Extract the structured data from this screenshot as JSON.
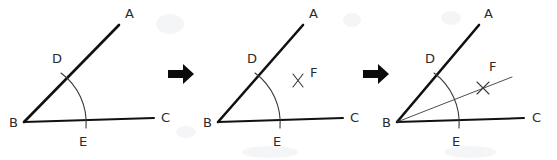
{
  "figure": {
    "background_color": "#ffffff",
    "ink_color": "#111111",
    "light_ink_color": "#3a3a3a",
    "arrow_glyph": "right-arrow",
    "panels": [
      {
        "id": "panel-1",
        "step": "1",
        "caption": "",
        "vertex_label": "B",
        "labels": [
          {
            "name": "label-a",
            "text": "A",
            "x": 125,
            "y": 18
          },
          {
            "name": "label-d",
            "text": "D",
            "x": 52,
            "y": 63
          },
          {
            "name": "label-b",
            "text": "B",
            "x": 9,
            "y": 127
          },
          {
            "name": "label-e",
            "text": "E",
            "x": 79,
            "y": 146
          },
          {
            "name": "label-c",
            "text": "C",
            "x": 161,
            "y": 122
          }
        ],
        "geometry": {
          "vertex": [
            24,
            122
          ],
          "ray_a_end": [
            119,
            25
          ],
          "ray_c_end": [
            154,
            118
          ],
          "arc_from": [
            66,
            79
          ],
          "arc_to": [
            86,
            126
          ],
          "point_d": [
            63,
            76
          ],
          "point_e": [
            85,
            120
          ]
        },
        "has_cross": false,
        "has_bisector": false
      },
      {
        "id": "panel-2",
        "step": "2",
        "caption": "",
        "vertex_label": "B",
        "labels": [
          {
            "name": "label-a",
            "text": "A",
            "x": 309,
            "y": 18
          },
          {
            "name": "label-d",
            "text": "D",
            "x": 247,
            "y": 63
          },
          {
            "name": "label-b",
            "text": "B",
            "x": 203,
            "y": 127
          },
          {
            "name": "label-e",
            "text": "E",
            "x": 273,
            "y": 146
          },
          {
            "name": "label-c",
            "text": "C",
            "x": 350,
            "y": 122
          },
          {
            "name": "label-f",
            "text": "F",
            "x": 310,
            "y": 77
          }
        ],
        "geometry": {
          "vertex": [
            218,
            122
          ],
          "ray_a_end": [
            303,
            25
          ],
          "ray_c_end": [
            343,
            118
          ],
          "arc_from": [
            260,
            79
          ],
          "arc_to": [
            280,
            126
          ],
          "point_d": [
            257,
            76
          ],
          "point_e": [
            279,
            120
          ],
          "cross_center": [
            299,
            80
          ]
        },
        "has_cross": true,
        "has_bisector": false
      },
      {
        "id": "panel-3",
        "step": "3",
        "caption": "",
        "vertex_label": "B",
        "labels": [
          {
            "name": "label-a",
            "text": "A",
            "x": 484,
            "y": 18
          },
          {
            "name": "label-d",
            "text": "D",
            "x": 425,
            "y": 63
          },
          {
            "name": "label-b",
            "text": "B",
            "x": 382,
            "y": 127
          },
          {
            "name": "label-e",
            "text": "E",
            "x": 452,
            "y": 146
          },
          {
            "name": "label-c",
            "text": "C",
            "x": 532,
            "y": 122
          },
          {
            "name": "label-f",
            "text": "F",
            "x": 489,
            "y": 71
          }
        ],
        "geometry": {
          "vertex": [
            397,
            122
          ],
          "ray_a_end": [
            479,
            25
          ],
          "ray_c_end": [
            524,
            118
          ],
          "arc_from": [
            438,
            79
          ],
          "arc_to": [
            459,
            126
          ],
          "point_d": [
            435,
            76
          ],
          "point_e": [
            458,
            120
          ],
          "cross_center": [
            483,
            88
          ],
          "bisector_end": [
            512,
            78
          ]
        },
        "has_cross": true,
        "has_bisector": true
      }
    ],
    "arrows": [
      {
        "name": "step-arrow-1",
        "x": 168,
        "y": 64,
        "width": 24,
        "height": 20
      },
      {
        "name": "step-arrow-2",
        "x": 363,
        "y": 64,
        "width": 24,
        "height": 20
      }
    ]
  }
}
